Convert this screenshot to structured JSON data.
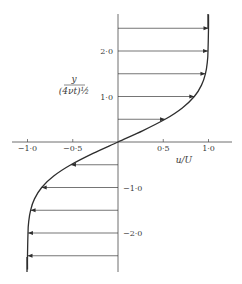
{
  "figure": {
    "x_axis": {
      "label": "u/U",
      "ticks": [
        "−1·0",
        "−0·5",
        "0·5",
        "1·0"
      ],
      "tick_values": [
        -1.0,
        -0.5,
        0.5,
        1.0
      ]
    },
    "y_axis": {
      "label_numerator": "y",
      "label_denominator": "(4νt)½",
      "ticks": [
        "2·0",
        "1·0",
        "−1·0",
        "−2·0"
      ],
      "tick_values": [
        2.0,
        1.0,
        -1.0,
        -2.0
      ]
    },
    "curve": {
      "name": "velocity-profile",
      "function": "u/U = erf(y/(4νt)^½)",
      "eta": [
        -2.8,
        -2.5,
        -2.0,
        -1.75,
        -1.5,
        -1.25,
        -1.0,
        -0.75,
        -0.5,
        -0.25,
        0,
        0.25,
        0.5,
        0.75,
        1.0,
        1.25,
        1.5,
        1.75,
        2.0,
        2.5,
        2.8
      ],
      "u": [
        -1.0,
        -1.0,
        -0.995,
        -0.987,
        -0.966,
        -0.923,
        -0.843,
        -0.711,
        -0.52,
        -0.276,
        0,
        0.276,
        0.52,
        0.711,
        0.843,
        0.923,
        0.966,
        0.987,
        0.995,
        1.0,
        1.0
      ]
    },
    "arrows": {
      "eta": [
        2.5,
        2.0,
        1.5,
        1.0,
        0.5,
        -0.5,
        -1.0,
        -1.5,
        -2.0,
        -2.5
      ],
      "u": [
        1.0,
        0.995,
        0.966,
        0.843,
        0.52,
        -0.52,
        -0.843,
        -0.966,
        -0.995,
        -1.0
      ]
    },
    "colors": {
      "ink": "#2e2e2e",
      "text": "#3a3a3a",
      "background": "#ffffff"
    }
  }
}
